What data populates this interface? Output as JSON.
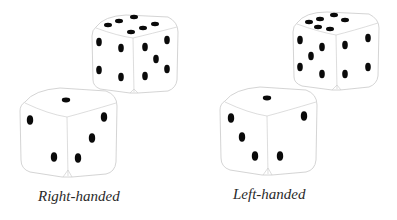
{
  "figure": {
    "panels": [
      {
        "caption": "Right-handed",
        "dice": [
          {
            "position": "back",
            "faces": {
              "top": 6,
              "left": 4,
              "right": 5
            }
          },
          {
            "position": "front",
            "faces": {
              "top": 1,
              "left": 2,
              "right": 3
            }
          }
        ]
      },
      {
        "caption": "Left-handed",
        "dice": [
          {
            "position": "back",
            "faces": {
              "top": 6,
              "left": 5,
              "right": 4
            }
          },
          {
            "position": "front",
            "faces": {
              "top": 1,
              "left": 3,
              "right": 2
            }
          }
        ]
      }
    ],
    "colors": {
      "pip": "#0a0a0a",
      "outline": "#c9c9c9",
      "background": "#ffffff",
      "caption": "#2a2a2a"
    }
  }
}
